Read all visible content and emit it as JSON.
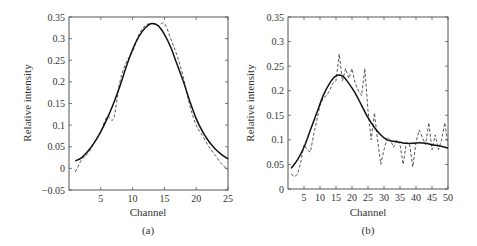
{
  "chart_data": [
    {
      "type": "line",
      "panel": "(a)",
      "title": "",
      "xlabel": "Channel",
      "ylabel": "Relative intensity",
      "xlim": [
        0,
        25
      ],
      "ylim": [
        -0.05,
        0.35
      ],
      "xticks": [
        5,
        10,
        15,
        20,
        25
      ],
      "yticks": [
        -0.05,
        0,
        0.05,
        0.1,
        0.15,
        0.2,
        0.25,
        0.3,
        0.35
      ],
      "ytick_labels": [
        "−0.05",
        "0",
        "0.05",
        "0.1",
        "0.15",
        "0.2",
        "0.25",
        "0.3",
        "0.35"
      ],
      "grid": false,
      "legend": null,
      "series": [
        {
          "name": "fitted (solid)",
          "style": "solid",
          "x": [
            1,
            2,
            3,
            4,
            5,
            6,
            7,
            8,
            9,
            10,
            11,
            12,
            13,
            14,
            15,
            16,
            17,
            18,
            19,
            20,
            21,
            22,
            23,
            24,
            25
          ],
          "values": [
            0.017,
            0.025,
            0.04,
            0.06,
            0.085,
            0.115,
            0.15,
            0.19,
            0.235,
            0.275,
            0.305,
            0.325,
            0.335,
            0.33,
            0.31,
            0.28,
            0.24,
            0.2,
            0.155,
            0.115,
            0.085,
            0.062,
            0.045,
            0.032,
            0.022
          ]
        },
        {
          "name": "measured (dashed)",
          "style": "dashed",
          "x": [
            1,
            2,
            3,
            4,
            5,
            6,
            7,
            8,
            9,
            10,
            11,
            12,
            13,
            14,
            15,
            16,
            17,
            18,
            19,
            20,
            21,
            22,
            23,
            24,
            25
          ],
          "values": [
            -0.008,
            0.02,
            0.035,
            0.06,
            0.085,
            0.12,
            0.115,
            0.2,
            0.245,
            0.27,
            0.31,
            0.33,
            0.335,
            0.33,
            0.335,
            0.3,
            0.26,
            0.21,
            0.145,
            0.1,
            0.075,
            0.05,
            0.03,
            0.01,
            -0.003
          ]
        }
      ]
    },
    {
      "type": "line",
      "panel": "(b)",
      "title": "",
      "xlabel": "Channel",
      "ylabel": "Relative intensity",
      "xlim": [
        0,
        50
      ],
      "ylim": [
        0,
        0.35
      ],
      "xticks": [
        5,
        10,
        15,
        20,
        25,
        30,
        35,
        40,
        45,
        50
      ],
      "yticks": [
        0,
        0.05,
        0.1,
        0.15,
        0.2,
        0.25,
        0.3,
        0.35
      ],
      "ytick_labels": [
        "0",
        "0.05",
        "0.1",
        "0.15",
        "0.2",
        "0.25",
        "0.3",
        "0.35"
      ],
      "grid": false,
      "legend": null,
      "series": [
        {
          "name": "fitted (solid)",
          "style": "solid",
          "x": [
            1,
            3,
            5,
            7,
            9,
            11,
            13,
            15,
            17,
            19,
            21,
            23,
            25,
            27,
            29,
            31,
            33,
            35,
            37,
            39,
            41,
            43,
            45,
            47,
            49,
            50
          ],
          "values": [
            0.042,
            0.06,
            0.085,
            0.12,
            0.155,
            0.19,
            0.215,
            0.23,
            0.23,
            0.215,
            0.195,
            0.17,
            0.145,
            0.125,
            0.11,
            0.1,
            0.097,
            0.095,
            0.093,
            0.093,
            0.094,
            0.093,
            0.09,
            0.088,
            0.085,
            0.083
          ]
        },
        {
          "name": "measured (dashed)",
          "style": "dashed",
          "x": [
            1,
            2,
            3,
            4,
            5,
            6,
            7,
            8,
            9,
            10,
            11,
            12,
            13,
            14,
            15,
            16,
            17,
            18,
            19,
            20,
            21,
            22,
            23,
            24,
            25,
            26,
            27,
            28,
            29,
            30,
            31,
            32,
            33,
            34,
            35,
            36,
            37,
            38,
            39,
            40,
            41,
            42,
            43,
            44,
            45,
            46,
            47,
            48,
            49,
            50
          ],
          "values": [
            0.03,
            0.025,
            0.03,
            0.055,
            0.09,
            0.08,
            0.075,
            0.11,
            0.14,
            0.17,
            0.185,
            0.19,
            0.2,
            0.215,
            0.22,
            0.275,
            0.22,
            0.245,
            0.225,
            0.245,
            0.215,
            0.2,
            0.19,
            0.245,
            0.16,
            0.1,
            0.155,
            0.1,
            0.05,
            0.08,
            0.105,
            0.1,
            0.085,
            0.1,
            0.09,
            0.05,
            0.095,
            0.09,
            0.045,
            0.095,
            0.12,
            0.105,
            0.09,
            0.135,
            0.08,
            0.11,
            0.08,
            0.1,
            0.135,
            0.09
          ]
        }
      ]
    }
  ],
  "panels": {
    "a": {
      "label": "(a)",
      "xlabel": "Channel",
      "ylabel": "Relative intensity",
      "xtick_labels": [
        "5",
        "10",
        "15",
        "20",
        "25"
      ],
      "ytick_labels": [
        "−0.05",
        "0",
        "0.05",
        "0.1",
        "0.15",
        "0.2",
        "0.25",
        "0.3",
        "0.35"
      ]
    },
    "b": {
      "label": "(b)",
      "xlabel": "Channel",
      "ylabel": "Relative intensity",
      "xtick_labels": [
        "5",
        "10",
        "15",
        "20",
        "25",
        "30",
        "35",
        "40",
        "45",
        "50"
      ],
      "ytick_labels": [
        "0",
        "0.05",
        "0.1",
        "0.15",
        "0.2",
        "0.25",
        "0.3",
        "0.35"
      ]
    }
  },
  "colors": {
    "axis": "#555555",
    "solid_line": "#111111",
    "dashed_line": "#444444",
    "text": "#333333"
  }
}
